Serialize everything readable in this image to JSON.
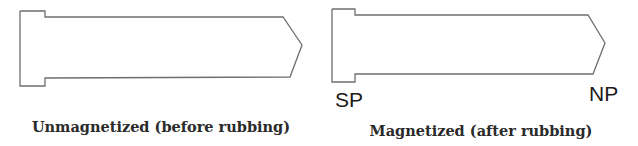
{
  "panels": [
    {
      "id": "unmagnetized",
      "caption": "Unmagnetized (before rubbing)",
      "shape": "bar-with-flanged-head-and-pointed-tip",
      "outline_points": "20,11 45,11 45,17 283,17 302,45 290,77 45,78 45,86 20,86 20,11",
      "pole_labels": []
    },
    {
      "id": "magnetized",
      "caption": "Magnetized (after rubbing)",
      "shape": "bar-with-flanged-head-and-pointed-tip",
      "outline_points": "332,9 355,9 355,15 588,15 605,43 593,74 355,74 355,82 332,82 332,9",
      "pole_labels": [
        {
          "text": "SP",
          "meaning": "south pole",
          "end": "head"
        },
        {
          "text": "NP",
          "meaning": "north pole",
          "end": "tip"
        }
      ]
    }
  ],
  "colors": {
    "outline": "#6f6f6f",
    "label_text": "#1a1a1a",
    "caption_text": "#2a2a2a",
    "background": "#ffffff"
  }
}
